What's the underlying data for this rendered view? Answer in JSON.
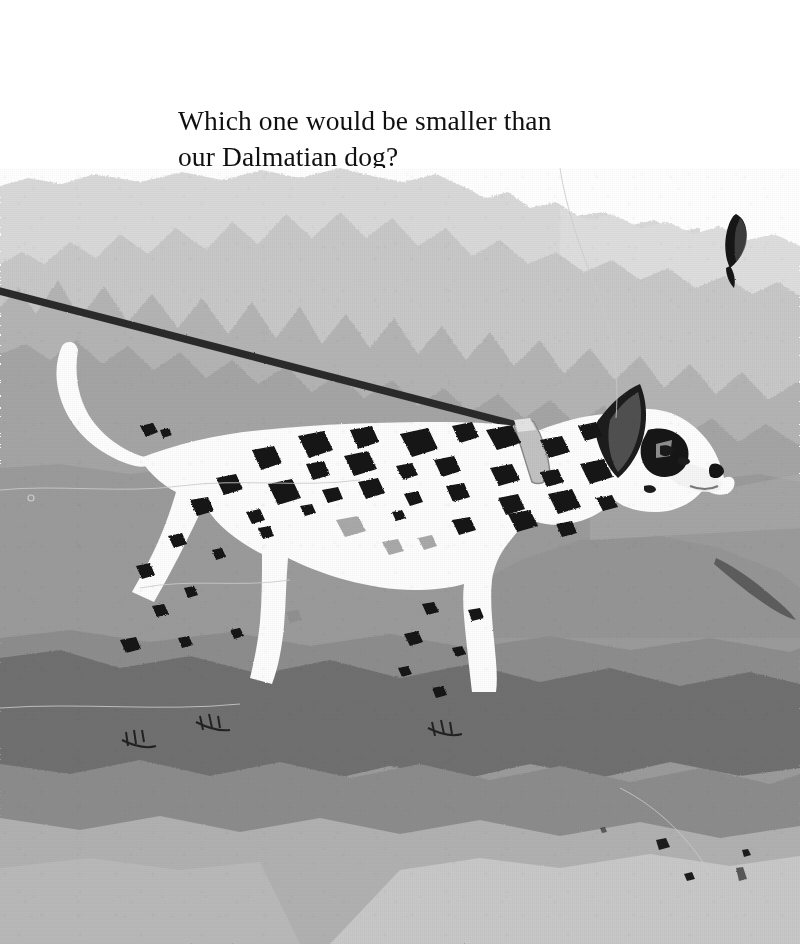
{
  "page": {
    "type": "picture-book-page",
    "width": 800,
    "height": 944,
    "background_color": "#ffffff",
    "technique": "torn-paper collage, grayscale"
  },
  "text": {
    "question": "Which one would be smaller than\nour Dalmatian dog?",
    "question_line1": "Which one would be smaller than",
    "question_line2": "our Dalmatian dog?",
    "color": "#101010",
    "font_size_px": 27.5
  },
  "illustration": {
    "title": "Dalmatian dog on a leash in front of layered hills",
    "subject": "Dalmatian dog",
    "subject_color": "#fdfdfd",
    "spot_color": "#101010",
    "leash": {
      "name": "leash",
      "color": "#2b2b2b",
      "start": [
        0,
        293
      ],
      "end": [
        516,
        428
      ],
      "thickness_px": 7
    },
    "collar": {
      "name": "collar",
      "color": "#b8b8b8"
    },
    "sky_color": "#ffffff",
    "layers": [
      {
        "name": "far-hill-pale",
        "color": "#d8d8d8"
      },
      {
        "name": "mid-hill-light",
        "color": "#c6c6c6"
      },
      {
        "name": "mid-hill-peaks",
        "color": "#b4b4b4"
      },
      {
        "name": "near-hill-gray",
        "color": "#a3a3a3"
      },
      {
        "name": "ground-plain-gray",
        "color": "#9a9a9a"
      },
      {
        "name": "ground-dark-band",
        "color": "#6f6f6f"
      },
      {
        "name": "ground-mid-band",
        "color": "#8b8b8b"
      },
      {
        "name": "foreground-light",
        "color": "#b0b0b0"
      },
      {
        "name": "foreground-palest",
        "color": "#c9c9c9"
      }
    ],
    "details": [
      {
        "name": "dark-leaf-shape",
        "color": "#111111",
        "position": [
          733,
          228
        ]
      },
      {
        "name": "twig-shape",
        "color": "#5a5a5a",
        "position": [
          745,
          572
        ]
      },
      {
        "name": "pebble",
        "color": "#1f1f1f",
        "position": [
          660,
          845
        ]
      },
      {
        "name": "pebble",
        "color": "#1f1f1f",
        "position": [
          687,
          876
        ]
      },
      {
        "name": "pebble",
        "color": "#2a2a2a",
        "position": [
          745,
          852
        ]
      },
      {
        "name": "hairline-crease",
        "color": "#cfcfcf"
      }
    ]
  }
}
